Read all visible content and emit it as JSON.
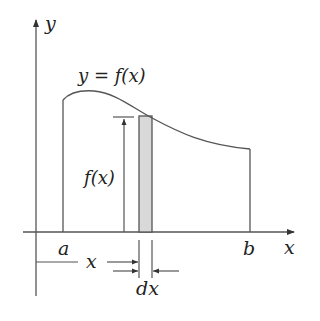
{
  "diagram": {
    "labels": {
      "y_axis": "y",
      "x_axis": "x",
      "curve": "y = f(x)",
      "height": "f(x)",
      "a": "a",
      "b": "b",
      "x_distance": "x",
      "strip_width": "dx"
    },
    "colors": {
      "line": "#555555",
      "strip_fill": "#d9d9d9",
      "text": "#222222"
    }
  }
}
